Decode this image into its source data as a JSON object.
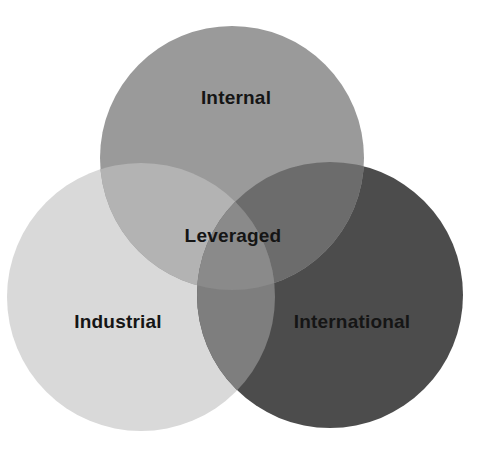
{
  "diagram": {
    "type": "venn",
    "sets": [
      {
        "id": "internal",
        "label": "Internal",
        "color": "#9a9a9a",
        "cx": 232,
        "cy": 158,
        "r": 132
      },
      {
        "id": "industrial",
        "label": "Industrial",
        "color": "#d9d9d9",
        "cx": 141,
        "cy": 297,
        "r": 134
      },
      {
        "id": "international",
        "label": "International",
        "color": "#4c4c4c",
        "cx": 330,
        "cy": 295,
        "r": 133
      }
    ],
    "intersection": {
      "label": "Leveraged"
    },
    "colors": {
      "background": "#ffffff",
      "text": "#151515",
      "internal_industrial_overlap": "#b3b3b3",
      "internal_international_overlap": "#6c6c6c",
      "industrial_international_overlap": "#7e7e7e",
      "center_overlap": "#8a8a8a"
    }
  }
}
